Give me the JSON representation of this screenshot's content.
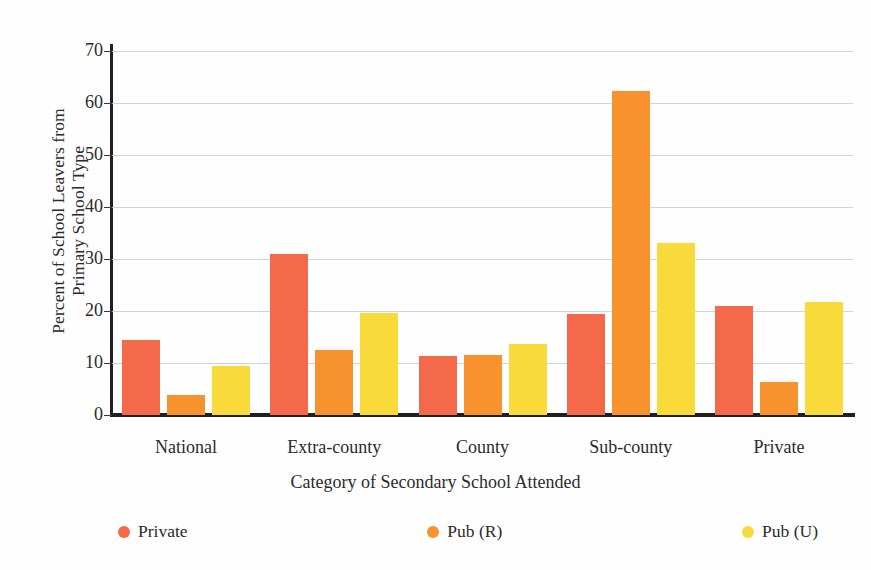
{
  "chart_data": {
    "type": "bar",
    "title": "",
    "xlabel": "Category of Secondary School Attended",
    "ylabel_line1": "Percent of School Leavers from",
    "ylabel_line2": "Primary School Type",
    "categories": [
      "National",
      "Extra-county",
      "County",
      "Sub-county",
      "Private"
    ],
    "series": [
      {
        "name": "Private",
        "color": "#F4694A",
        "values": [
          14.5,
          31.0,
          11.3,
          19.4,
          21.0
        ]
      },
      {
        "name": "Pub (R)",
        "color": "#F8922E",
        "values": [
          3.8,
          12.6,
          11.6,
          62.4,
          6.3
        ]
      },
      {
        "name": "Pub (U)",
        "color": "#F8DB3B",
        "values": [
          9.5,
          19.6,
          13.7,
          33.0,
          21.8
        ]
      }
    ],
    "ylim": [
      0,
      70.6
    ],
    "yticks": [
      0,
      10,
      20,
      30,
      40,
      50,
      60,
      70
    ],
    "ytick_labels": [
      "0",
      "10",
      "20",
      "30",
      "40",
      "50",
      "60",
      "70"
    ],
    "grid": true,
    "legend_position": "bottom",
    "axis_color": "#231f20",
    "gridline_color": "#c9ccd4",
    "background": "#ffffff"
  }
}
